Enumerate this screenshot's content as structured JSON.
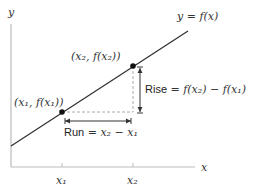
{
  "diagram": {
    "type": "slope-rise-over-run",
    "axes": {
      "x_label": "x",
      "y_label": "y",
      "x_ticks": [
        "x₁",
        "x₂"
      ]
    },
    "curve_label": "y = f(x)",
    "points": [
      {
        "label": "(x₁, f(x₁))",
        "name": "point-1"
      },
      {
        "label": "(x₂, f(x₂))",
        "name": "point-2"
      }
    ],
    "rise": {
      "word": "Rise",
      "expr": " = f(x₂) − f(x₁)"
    },
    "run": {
      "word": "Run",
      "expr": " = x₂ − x₁"
    },
    "colors": {
      "axis": "#bbbbbb",
      "line": "#333333",
      "point": "#111111",
      "dashed": "#aaaaaa",
      "arrow": "#333333"
    }
  }
}
